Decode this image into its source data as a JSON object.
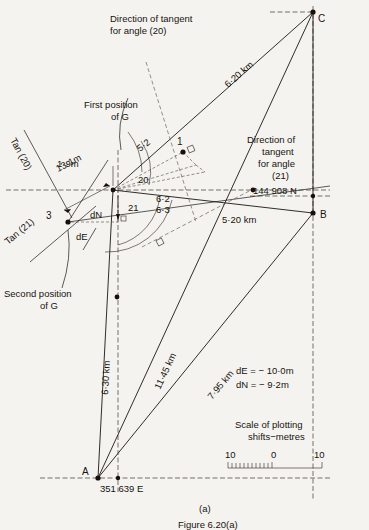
{
  "figure": {
    "subfigure_label": "(a)",
    "figure_number": "Figure 6.20(a)"
  },
  "stations": {
    "A": "A",
    "B": "B",
    "C": "C",
    "point_1": "1",
    "point_3": "3"
  },
  "annotations": {
    "tangent20_line1": "Direction of tangent",
    "tangent20_line2": "for angle (20)",
    "tangent21_line1": "Direction of",
    "tangent21_line2": "tangent",
    "tangent21_line3": "for angle",
    "tangent21_line4": "(21)",
    "first_position_line1": "First position",
    "first_position_line2": "of G",
    "second_position_line1": "Second position",
    "second_position_line2": "of G",
    "tan20": "Tan (20)",
    "tan21": "Tan (21)"
  },
  "distances": {
    "c_to_g": "6·20 km",
    "b_to_g": "5·20 km",
    "a_to_g": "6·30 km",
    "a_to_c": "11·45 km",
    "a_to_b": "7·95 km"
  },
  "dimensions": {
    "d13_1m": "13·1m",
    "d1_9m": "1·9m",
    "d5_2": "5·2",
    "d6_2": "6·2",
    "d6_3": "6·3",
    "dN": "dN",
    "dE": "dE"
  },
  "angles": {
    "angle20": "20",
    "angle21": "21"
  },
  "coordinates": {
    "northing": "144 908 N",
    "easting": "351 639 E"
  },
  "shifts": {
    "dE_value": "dE = − 10·0m",
    "dN_value": "dN = − 9·2m"
  },
  "scale_bar": {
    "title_line1": "Scale of plotting",
    "title_line2": "shifts−metres",
    "tick_left": "10",
    "tick_center": "0",
    "tick_right": "10"
  }
}
